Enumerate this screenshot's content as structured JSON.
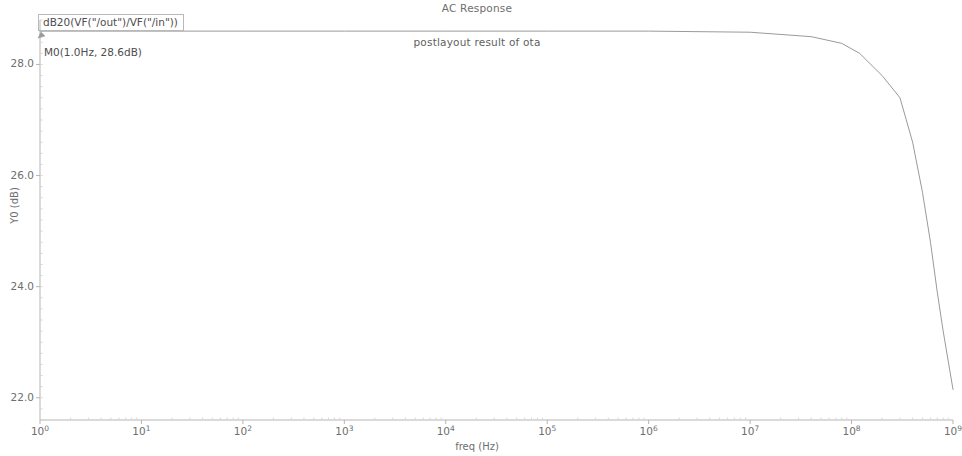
{
  "chart_data": {
    "type": "line",
    "title": "AC Response",
    "subtitle": "postlayout result of ota",
    "xlabel": "freq (Hz)",
    "ylabel": "Y0 (dB)",
    "xscale": "log",
    "yscale": "linear",
    "xlim": [
      1,
      1000000000
    ],
    "ylim": [
      21.6,
      28.8
    ],
    "grid": false,
    "legend_position": "top-left",
    "series": [
      {
        "name": "dB20(VF(\"/out\")/VF(\"/in\"))",
        "color": "#9a9a9a",
        "x": [
          1,
          10,
          100,
          1000,
          10000,
          100000,
          1000000,
          10000000,
          40000000,
          80000000,
          120000000,
          200000000,
          300000000,
          400000000,
          500000000,
          600000000,
          700000000,
          800000000,
          1000000000
        ],
        "y": [
          28.6,
          28.6,
          28.6,
          28.6,
          28.6,
          28.6,
          28.6,
          28.58,
          28.5,
          28.38,
          28.2,
          27.8,
          27.4,
          26.6,
          25.7,
          24.8,
          23.9,
          23.2,
          22.15
        ]
      }
    ],
    "markers": [
      {
        "name": "M0",
        "label": "M0(1.0Hz, 28.6dB)",
        "x": 1,
        "y": 28.6
      }
    ],
    "xticks": [
      {
        "value": 1,
        "mantissa": "10",
        "exponent": "0"
      },
      {
        "value": 10,
        "mantissa": "10",
        "exponent": "1"
      },
      {
        "value": 100,
        "mantissa": "10",
        "exponent": "2"
      },
      {
        "value": 1000,
        "mantissa": "10",
        "exponent": "3"
      },
      {
        "value": 10000,
        "mantissa": "10",
        "exponent": "4"
      },
      {
        "value": 100000,
        "mantissa": "10",
        "exponent": "5"
      },
      {
        "value": 1000000,
        "mantissa": "10",
        "exponent": "6"
      },
      {
        "value": 10000000,
        "mantissa": "10",
        "exponent": "7"
      },
      {
        "value": 100000000,
        "mantissa": "10",
        "exponent": "8"
      },
      {
        "value": 1000000000,
        "mantissa": "10",
        "exponent": "9"
      }
    ],
    "yticks": [
      {
        "value": 28.0,
        "label": "28.0"
      },
      {
        "value": 26.0,
        "label": "26.0"
      },
      {
        "value": 24.0,
        "label": "24.0"
      },
      {
        "value": 22.0,
        "label": "22.0"
      }
    ],
    "colors": {
      "trace": "#9a9a9a",
      "axis": "#b5b5b5",
      "text": "#6e6e6e"
    }
  }
}
